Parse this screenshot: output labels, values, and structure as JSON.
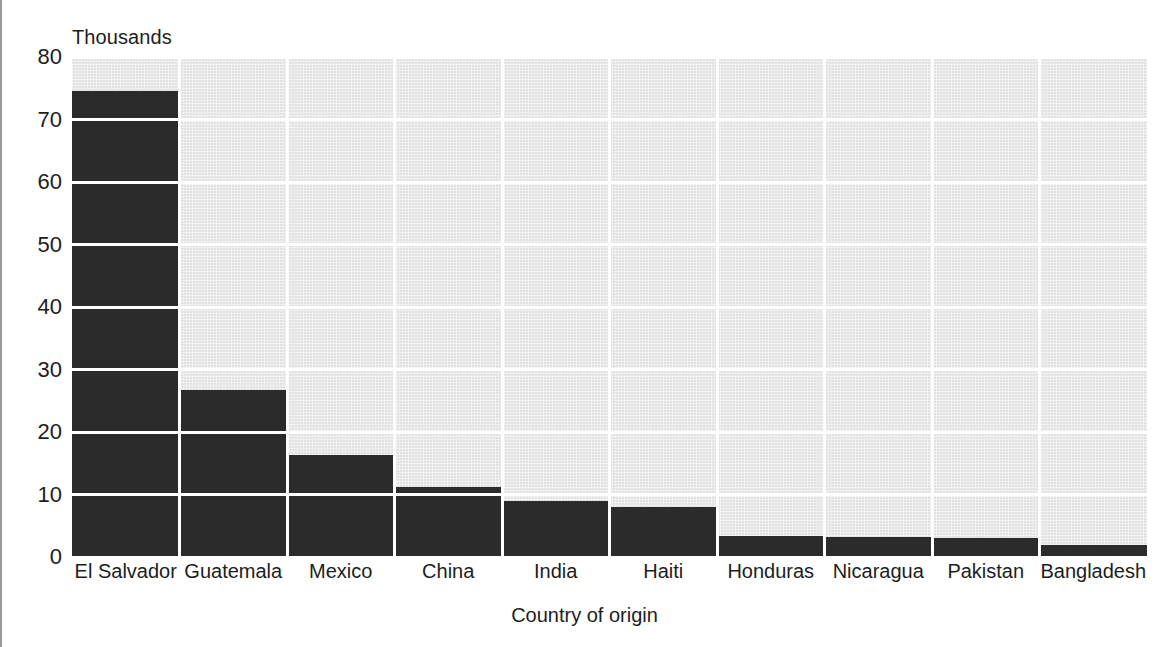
{
  "chart_data": {
    "type": "bar",
    "title": "",
    "subtitle": "",
    "unit_caption": "Thousands",
    "xlabel": "Country of origin",
    "ylabel": "",
    "ylim": [
      0,
      80
    ],
    "ytick_labels": [
      "0",
      "10",
      "20",
      "30",
      "40",
      "50",
      "60",
      "70",
      "80"
    ],
    "ytick_values": [
      0,
      10,
      20,
      30,
      40,
      50,
      60,
      70,
      80
    ],
    "grid": "horizontal-and-vertical",
    "legend": "none",
    "orientation": "vertical",
    "bar_color": "#2b2b2b",
    "plot_background_color": "#e2e2e2",
    "gridline_color": "#ffffff",
    "categories": [
      "El Salvador",
      "Guatemala",
      "Mexico",
      "China",
      "India",
      "Haiti",
      "Honduras",
      "Nicaragua",
      "Pakistan",
      "Bangladesh"
    ],
    "values": [
      74.5,
      26.7,
      16.3,
      11.2,
      9.0,
      8.0,
      3.4,
      3.2,
      3.1,
      2.0
    ]
  }
}
